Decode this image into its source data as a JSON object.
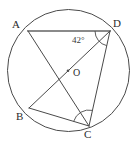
{
  "figure": {
    "kind": "circle-geometry-diagram",
    "canvas": {
      "width": 134,
      "height": 144,
      "background": "#ffffff"
    },
    "stroke_color": "#4a4a4a",
    "highlight_color": "#8a8a8a",
    "circle": {
      "name": "circumscribed-circle",
      "cx": 68.5,
      "cy": 70.5,
      "r": 61.0,
      "stroke": "#4a4a4a",
      "stroke_width": 1.0
    },
    "center": {
      "name": "center-point-O",
      "label": "O",
      "x": 68.0,
      "y": 70.8,
      "label_x": 73,
      "label_y": 68,
      "dot_r": 1.3
    },
    "points": [
      {
        "id": "A",
        "label": "A",
        "x": 28.0,
        "y": 31.0,
        "label_x": 12,
        "label_y": 19
      },
      {
        "id": "D",
        "label": "D",
        "x": 110.0,
        "y": 31.0,
        "label_x": 113,
        "label_y": 18
      },
      {
        "id": "B",
        "label": "B",
        "x": 29.0,
        "y": 108.0,
        "label_x": 16,
        "label_y": 111
      },
      {
        "id": "C",
        "label": "C",
        "x": 89.0,
        "y": 126.0,
        "label_x": 84,
        "label_y": 129
      }
    ],
    "chords": [
      {
        "name": "chord-A-D",
        "from": "A",
        "to": "D",
        "stroke": "#8a8a8a",
        "stroke_width": 2.2
      },
      {
        "name": "chord-A-C",
        "from": "A",
        "to": "C",
        "stroke": "#4a4a4a",
        "stroke_width": 1.0
      },
      {
        "name": "chord-B-D",
        "from": "B",
        "to": "D",
        "stroke": "#4a4a4a",
        "stroke_width": 1.0
      },
      {
        "name": "chord-B-C",
        "from": "B",
        "to": "C",
        "stroke": "#4a4a4a",
        "stroke_width": 1.0
      },
      {
        "name": "chord-D-C",
        "from": "D",
        "to": "C",
        "stroke": "#4a4a4a",
        "stroke_width": 1.0
      }
    ],
    "angles": [
      {
        "name": "angle-at-D",
        "vertex": "D",
        "label": "42°",
        "value": 42,
        "unit": "degrees",
        "label_x": 72,
        "label_y": 36,
        "arc_radius": 15,
        "arc_from": "A",
        "arc_to": "C"
      },
      {
        "name": "angle-arc-at-C",
        "vertex": "C",
        "label": "",
        "value": null,
        "arc_radius": 16,
        "arc_from": "B",
        "arc_to": "D"
      }
    ]
  }
}
